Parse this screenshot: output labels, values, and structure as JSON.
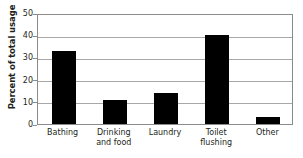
{
  "chart_data": {
    "type": "bar",
    "title": "",
    "xlabel": "",
    "ylabel": "Percent of total usage",
    "categories": [
      "Bathing",
      "Drinking and food",
      "Laundry",
      "Toilet flushing",
      "Other"
    ],
    "category_lines": [
      [
        "Bathing"
      ],
      [
        "Drinking",
        "and food"
      ],
      [
        "Laundry"
      ],
      [
        "Toilet",
        "flushing"
      ],
      [
        "Other"
      ]
    ],
    "values": [
      33,
      11,
      14,
      40,
      3
    ],
    "ylim": [
      0,
      50
    ],
    "yticks": [
      0,
      10,
      20,
      30,
      40,
      50
    ],
    "ytick_labels": [
      "0",
      "10",
      "20",
      "30",
      "40",
      "50"
    ],
    "grid": "horizontal",
    "legend": "none",
    "bar_color": "#000000",
    "axis_color": "#8b8b8b",
    "gridline_color": "#a8a8a8",
    "background_color": "#ffffff"
  }
}
